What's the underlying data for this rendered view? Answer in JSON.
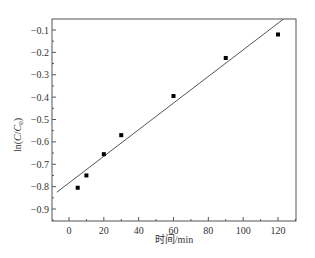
{
  "chart_data": {
    "type": "scatter",
    "title": "",
    "xlabel": "时间/min",
    "ylabel": "ln(C/C0)",
    "ylabel_parts": {
      "prefix": "ln(",
      "c": "C",
      "slash": "/",
      "c0": "C",
      "sub": "0",
      "suffix": ")"
    },
    "xlim": [
      -10,
      130
    ],
    "ylim": [
      -0.95,
      -0.05
    ],
    "xticks": [
      0,
      20,
      40,
      60,
      80,
      100,
      120
    ],
    "xtick_labels": [
      "0",
      "20",
      "40",
      "60",
      "80",
      "100",
      "120"
    ],
    "yticks": [
      -0.1,
      -0.2,
      -0.3,
      -0.4,
      -0.5,
      -0.6,
      -0.7,
      -0.8,
      -0.9
    ],
    "ytick_labels": [
      "-0.1",
      "-0.2",
      "-0.3",
      "-0.4",
      "-0.5",
      "-0.6",
      "-0.7",
      "-0.8",
      "-0.9"
    ],
    "grid": false,
    "legend": null,
    "series": [
      {
        "name": "experimental",
        "marker": "square",
        "color": "#000000",
        "x": [
          5,
          10,
          20,
          30,
          60,
          90,
          120
        ],
        "y": [
          -0.805,
          -0.75,
          -0.655,
          -0.57,
          -0.395,
          -0.225,
          -0.12
        ]
      },
      {
        "name": "linear fit",
        "style": "line",
        "color": "#555555",
        "x": [
          -7,
          125
        ],
        "y": [
          -0.825,
          -0.04
        ]
      }
    ]
  }
}
